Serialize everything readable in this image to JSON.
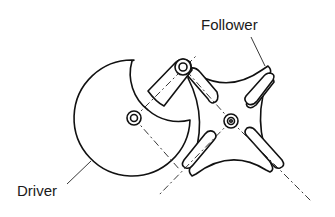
{
  "diagram": {
    "type": "mechanism",
    "labels": {
      "follower": "Follower",
      "driver": "Driver"
    },
    "components": [
      {
        "name": "driver",
        "shape": "disc with crescent cutout and pin arm",
        "center": [
          134,
          118
        ]
      },
      {
        "name": "drive-pin",
        "shape": "circle",
        "center": [
          183,
          67
        ]
      },
      {
        "name": "follower",
        "shape": "four-slot Geneva wheel",
        "center": [
          231,
          121
        ],
        "slots": 4
      }
    ],
    "colors": {
      "line": "#111111",
      "background": "#ffffff"
    }
  }
}
